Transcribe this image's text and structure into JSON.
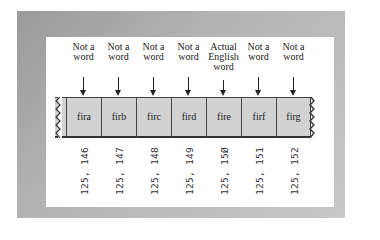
{
  "figure": {
    "columns": [
      {
        "heading": [
          "Not a",
          "word"
        ],
        "cell": "fira",
        "address": "125,146"
      },
      {
        "heading": [
          "Not a",
          "word"
        ],
        "cell": "firb",
        "address": "125,147"
      },
      {
        "heading": [
          "Not a",
          "word"
        ],
        "cell": "firc",
        "address": "125,148"
      },
      {
        "heading": [
          "Not a",
          "word"
        ],
        "cell": "fird",
        "address": "125,149"
      },
      {
        "heading": [
          "Actual",
          "English",
          "word"
        ],
        "cell": "fire",
        "address": "125,150"
      },
      {
        "heading": [
          "Not a",
          "word"
        ],
        "cell": "firf",
        "address": "125,151"
      },
      {
        "heading": [
          "Not a",
          "word"
        ],
        "cell": "firg",
        "address": "125,152"
      }
    ],
    "address_display": [
      "125, 146",
      "125, 147",
      "125, 148",
      "125, 149",
      "125, 15Ø",
      "125, 151",
      "125, 152"
    ],
    "heading_text": [
      "Not a\nword",
      "Not a\nword",
      "Not a\nword",
      "Not a\nword",
      "Actual\nEnglish\nword",
      "Not a\nword",
      "Not a\nword"
    ],
    "colors": {
      "frame": "#b4b4b4",
      "panel": "#ffffff",
      "tape_cell": "#d2d2d2",
      "ink": "#222222"
    }
  }
}
